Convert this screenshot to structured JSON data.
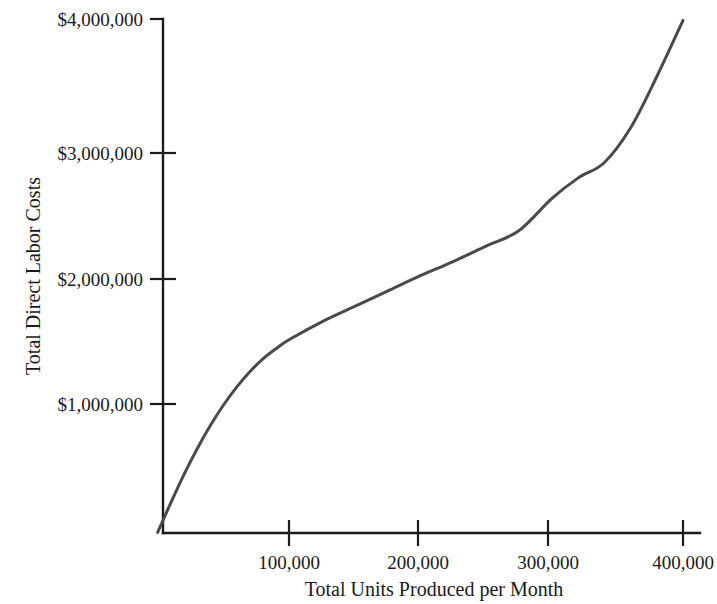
{
  "chart_data": {
    "type": "line",
    "title": "",
    "xlabel": "Total Units Produced per Month",
    "ylabel": "Total Direct Labor Costs",
    "xlim": [
      0,
      400000
    ],
    "ylim": [
      0,
      4000000
    ],
    "grid": false,
    "legend": null,
    "xtick_labels": [
      "100,000",
      "200,000",
      "300,000",
      "400,000"
    ],
    "xtick_values": [
      100000,
      200000,
      300000,
      400000
    ],
    "ytick_labels": [
      "$1,000,000",
      "$2,000,000",
      "$3,000,000",
      "$4,000,000"
    ],
    "ytick_values": [
      1000000,
      2000000,
      3000000,
      4000000
    ],
    "series": [
      {
        "name": "Total Direct Labor Costs",
        "color": "#4a4a4a",
        "line_width": 3,
        "x": [
          0,
          10000,
          20000,
          30000,
          40000,
          50000,
          60000,
          70000,
          80000,
          90000,
          100000,
          125000,
          150000,
          175000,
          200000,
          225000,
          250000,
          275000,
          300000,
          320000,
          340000,
          360000,
          380000,
          400000
        ],
        "values": [
          0,
          230000,
          450000,
          650000,
          830000,
          990000,
          1130000,
          1250000,
          1350000,
          1430000,
          1500000,
          1640000,
          1760000,
          1880000,
          2000000,
          2110000,
          2230000,
          2350000,
          2600000,
          2760000,
          2880000,
          3150000,
          3550000,
          3990000
        ]
      }
    ]
  },
  "axis_labels": {
    "x_title": "Total Units Produced per Month",
    "y_title": "Total Direct Labor Costs"
  }
}
